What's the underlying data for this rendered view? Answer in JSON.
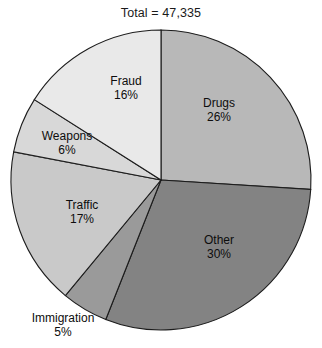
{
  "chart_data": {
    "type": "pie",
    "title": "Total = 47,335",
    "total_label": "Total",
    "total_value": "47,335",
    "xlabel": "",
    "ylabel": "",
    "legend": "none",
    "grid": false,
    "start_angle_deg": 0,
    "direction": "clockwise",
    "categories": [
      "Drugs",
      "Other",
      "Immigration",
      "Traffic",
      "Weapons",
      "Fraud"
    ],
    "values": [
      26,
      30,
      5,
      17,
      6,
      16
    ],
    "slices": [
      {
        "name": "Drugs",
        "label": "Drugs",
        "percent": 26,
        "percent_label": "26%",
        "color": "#b8b8b8",
        "label_x": 219,
        "label_y": 110,
        "label_position": "inside"
      },
      {
        "name": "Other",
        "label": "Other",
        "percent": 30,
        "percent_label": "30%",
        "color": "#838383",
        "label_x": 219,
        "label_y": 247,
        "label_position": "inside"
      },
      {
        "name": "Immigration",
        "label": "Immigration",
        "percent": 5,
        "percent_label": "5%",
        "color": "#9a9a9a",
        "label_x": 63,
        "label_y": 325,
        "label_position": "outside"
      },
      {
        "name": "Traffic",
        "label": "Traffic",
        "percent": 17,
        "percent_label": "17%",
        "color": "#c9c9c9",
        "label_x": 82,
        "label_y": 212,
        "label_position": "inside"
      },
      {
        "name": "Weapons",
        "label": "Weapons",
        "percent": 6,
        "percent_label": "6%",
        "color": "#d8d8d8",
        "label_x": 67,
        "label_y": 143,
        "label_position": "inside"
      },
      {
        "name": "Fraud",
        "label": "Fraud",
        "percent": 16,
        "percent_label": "16%",
        "color": "#e9e9e9",
        "label_x": 126,
        "label_y": 88,
        "label_position": "inside"
      }
    ],
    "geometry": {
      "center_x": 161,
      "center_y": 180,
      "radius": 150,
      "stroke_color": "#1c1c1c"
    }
  }
}
